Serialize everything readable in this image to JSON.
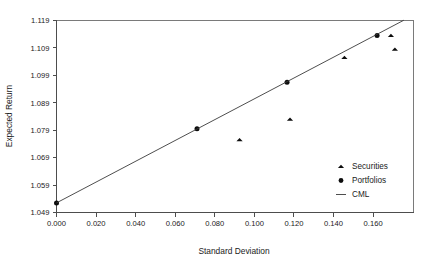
{
  "chart_data": {
    "type": "scatter",
    "title": "",
    "xlabel": "Standard Deviation",
    "ylabel": "Expected Return",
    "xlim": [
      0.0,
      0.18
    ],
    "ylim": [
      1.049,
      1.119
    ],
    "grid": false,
    "legend_position": "inside-bottom-right",
    "x_ticks": [
      "0.000",
      "0.020",
      "0.040",
      "0.060",
      "0.080",
      "0.100",
      "0.120",
      "0.140",
      "0.160"
    ],
    "x_tick_values": [
      0.0,
      0.02,
      0.04,
      0.06,
      0.08,
      0.1,
      0.12,
      0.14,
      0.16
    ],
    "y_ticks": [
      "1.049",
      "1.059",
      "1.069",
      "1.079",
      "1.089",
      "1.099",
      "1.109",
      "1.119"
    ],
    "y_tick_values": [
      1.049,
      1.059,
      1.069,
      1.079,
      1.089,
      1.099,
      1.109,
      1.119
    ],
    "series": [
      {
        "name": "Securities",
        "marker": "triangle",
        "color": "#0d0d0d",
        "points": [
          {
            "x": 0.0925,
            "y": 1.0755
          },
          {
            "x": 0.118,
            "y": 1.083
          },
          {
            "x": 0.1455,
            "y": 1.1055
          },
          {
            "x": 0.169,
            "y": 1.1135
          },
          {
            "x": 0.171,
            "y": 1.1085
          }
        ]
      },
      {
        "name": "Portfolios",
        "marker": "circle",
        "color": "#0d0d0d",
        "points": [
          {
            "x": 0.0,
            "y": 1.0525
          },
          {
            "x": 0.071,
            "y": 1.0795
          },
          {
            "x": 0.1165,
            "y": 1.0965
          },
          {
            "x": 0.162,
            "y": 1.1135
          }
        ]
      },
      {
        "name": "CML",
        "marker": "line",
        "color": "#3a3a3a",
        "points": [
          {
            "x": 0.0,
            "y": 1.0525
          },
          {
            "x": 0.1755,
            "y": 1.1191
          }
        ]
      }
    ],
    "legend": [
      {
        "label": "Securities",
        "marker": "triangle"
      },
      {
        "label": "Portfolios",
        "marker": "circle"
      },
      {
        "label": "CML",
        "marker": "line"
      }
    ]
  }
}
